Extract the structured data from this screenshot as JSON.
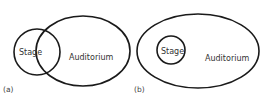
{
  "diagram": {
    "type": "venn",
    "panels": [
      {
        "id": "a",
        "label": "(a)",
        "relation": "overlapping",
        "sets": [
          {
            "name": "Stage",
            "label": "Stage",
            "shape": "circle",
            "cx": 37,
            "cy": 52,
            "rx": 23,
            "ry": 23
          },
          {
            "name": "Auditorium",
            "label": "Auditorium",
            "shape": "ellipse",
            "cx": 83,
            "cy": 51,
            "rx": 47,
            "ry": 35
          }
        ]
      },
      {
        "id": "b",
        "label": "(b)",
        "relation": "contained",
        "sets": [
          {
            "name": "Auditorium",
            "label": "Auditorium",
            "shape": "ellipse",
            "cx": 198,
            "cy": 51,
            "rx": 61,
            "ry": 37
          },
          {
            "name": "Stage",
            "label": "Stage",
            "shape": "circle",
            "cx": 171,
            "cy": 50,
            "rx": 14,
            "ry": 14
          }
        ]
      }
    ]
  }
}
